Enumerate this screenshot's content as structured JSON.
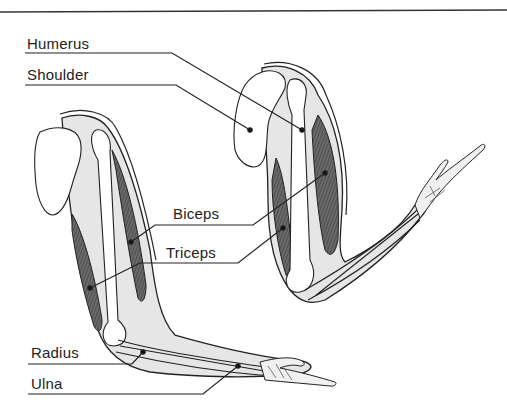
{
  "diagram": {
    "type": "anatomical-illustration",
    "labels": {
      "humerus": "Humerus",
      "shoulder": "Shoulder",
      "biceps": "Biceps",
      "triceps": "Triceps",
      "radius": "Radius",
      "ulna": "Ulna"
    },
    "colors": {
      "ink": "#222222",
      "muscle": "#555555",
      "tissue": "#e6e6e6",
      "bone": "#ffffff",
      "rule": "#333333"
    }
  }
}
